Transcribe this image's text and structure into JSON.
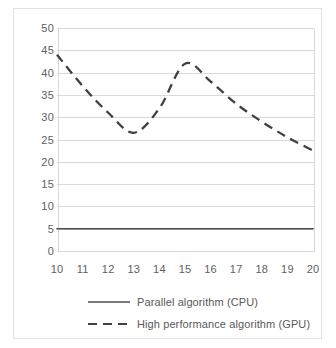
{
  "chart_data": {
    "type": "line",
    "title": "",
    "xlabel": "",
    "ylabel": "",
    "x": [
      10,
      11,
      12,
      13,
      14,
      15,
      16,
      17,
      18,
      19,
      20
    ],
    "xlim": [
      10,
      20
    ],
    "ylim": [
      0,
      50
    ],
    "grid": true,
    "legend_position": "bottom",
    "y_ticks": [
      "0",
      "5",
      "10",
      "15",
      "20",
      "25",
      "30",
      "35",
      "40",
      "45",
      "50"
    ],
    "x_ticks": [
      "10",
      "11",
      "12",
      "13",
      "14",
      "15",
      "16",
      "17",
      "18",
      "19",
      "20"
    ],
    "series": [
      {
        "name": "Parallel algorithm (CPU)",
        "style": "solid",
        "color": "#4d4d4d",
        "values": [
          5,
          5,
          5,
          5,
          5,
          5,
          5,
          5,
          5,
          5,
          5
        ]
      },
      {
        "name": "High performance algorithm (GPU)",
        "style": "dashed",
        "color": "#404040",
        "values": [
          44,
          37,
          31,
          26.5,
          32,
          42,
          38,
          33,
          29,
          25.5,
          22.5
        ]
      }
    ]
  },
  "legend": {
    "items": [
      {
        "label": "Parallel algorithm (CPU)",
        "style": "solid"
      },
      {
        "label": "High performance algorithm (GPU)",
        "style": "dashed"
      }
    ]
  },
  "colors": {
    "grid": "#d9d9d9",
    "border": "#e2e2e2",
    "tick_text": "#606060",
    "legend_text": "#595959",
    "series_cpu": "#4d4d4d",
    "series_gpu": "#404040"
  }
}
